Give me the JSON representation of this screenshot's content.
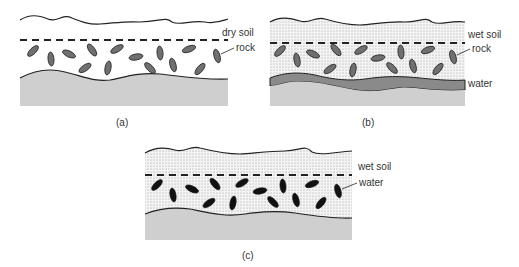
{
  "panels": [
    {
      "id": "a",
      "caption": "(a)",
      "soil_label": "dry soil",
      "pointer_label": "rock",
      "soil_state": "dry",
      "rock_color": "#707070"
    },
    {
      "id": "b",
      "caption": "(b)",
      "soil_label": "wet soil",
      "pointer_label": "rock",
      "water_label": "water",
      "soil_state": "wet",
      "rock_color": "#707070",
      "water_color": "#8a8a8a"
    },
    {
      "id": "c",
      "caption": "(c)",
      "soil_label": "wet soil",
      "pointer_label": "water",
      "soil_state": "wet",
      "rock_color": "#111111"
    }
  ],
  "colors": {
    "bedrock": "#cfcfcf",
    "line": "#222222",
    "stipple": "#9a9a9a"
  }
}
